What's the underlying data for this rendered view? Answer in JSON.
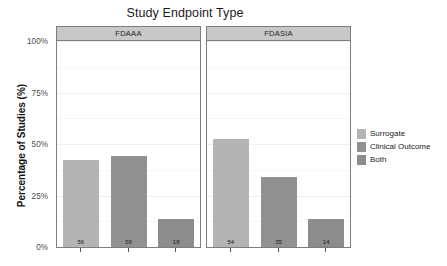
{
  "chart_data": {
    "type": "bar",
    "title": "Study Endpoint Type",
    "xlabel": "",
    "ylabel": "Percentage of Studies (%)",
    "ylim": [
      0,
      100
    ],
    "ytick_labels": [
      "0%",
      "25%",
      "50%",
      "75%",
      "100%"
    ],
    "ytick_values": [
      0,
      25,
      50,
      75,
      100
    ],
    "grid": true,
    "legend_position": "right",
    "facets": [
      {
        "label": "FDAAA",
        "bars": [
          {
            "series": "Surrogate",
            "percent": 42.1,
            "count": "56"
          },
          {
            "series": "Clinical Outcome",
            "percent": 44.4,
            "count": "59"
          },
          {
            "series": "Both",
            "percent": 13.5,
            "count": "18"
          }
        ]
      },
      {
        "label": "FDASIA",
        "bars": [
          {
            "series": "Surrogate",
            "percent": 52.4,
            "count": "54"
          },
          {
            "series": "Clinical Outcome",
            "percent": 34.0,
            "count": "35"
          },
          {
            "series": "Both",
            "percent": 13.6,
            "count": "14"
          }
        ]
      }
    ],
    "legend": [
      {
        "label": "Surrogate",
        "color": "#b4b4b4"
      },
      {
        "label": "Clinical Outcome",
        "color": "#919191"
      },
      {
        "label": "Both",
        "color": "#8c8c8c"
      }
    ],
    "colors": {
      "surrogate": "#b4b4b4",
      "clinical_outcome": "#919191",
      "both": "#8c8c8c",
      "strip_background": "#c8c8c8",
      "panel_border": "#7d7d7d",
      "gridline": "#efefef",
      "text": "#1a1a1a"
    }
  }
}
